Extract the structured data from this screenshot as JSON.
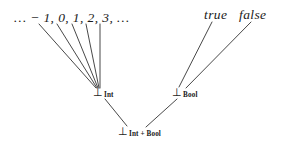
{
  "figure": {
    "type": "hasse-diagram",
    "background_color": "#ffffff",
    "line_color": "#333333",
    "text_color": "#1a1a1a",
    "width": 284,
    "height": 149
  },
  "labels": {
    "integers": "… − 1, 0, 1, 2, 3, …",
    "true": "true",
    "false": "false"
  },
  "nodes": [
    {
      "id": "bot-int",
      "tack": "⊥",
      "subscript": "Int",
      "x": 97,
      "y": 92
    },
    {
      "id": "bot-bool",
      "tack": "⊥",
      "subscript": "Bool",
      "x": 176,
      "y": 92
    },
    {
      "id": "bot-int-bool",
      "tack": "⊥",
      "subscript": "Int + Bool",
      "x": 122,
      "y": 131
    }
  ],
  "edges": [
    {
      "from": "int-elem-1",
      "x1": 39,
      "y1": 24,
      "x2": 96,
      "y2": 88
    },
    {
      "from": "int-elem-2",
      "x1": 57,
      "y1": 24,
      "x2": 97,
      "y2": 88
    },
    {
      "from": "int-elem-3",
      "x1": 72,
      "y1": 24,
      "x2": 98,
      "y2": 88
    },
    {
      "from": "int-elem-4",
      "x1": 86,
      "y1": 24,
      "x2": 99,
      "y2": 88
    },
    {
      "from": "int-elem-5",
      "x1": 100,
      "y1": 24,
      "x2": 100,
      "y2": 88
    },
    {
      "from": "true",
      "x1": 212,
      "y1": 22,
      "x2": 179,
      "y2": 87
    },
    {
      "from": "false",
      "x1": 251,
      "y1": 22,
      "x2": 186,
      "y2": 88
    },
    {
      "from": "bot-int",
      "x1": 105,
      "y1": 99,
      "x2": 127,
      "y2": 126
    },
    {
      "from": "bot-bool",
      "x1": 177,
      "y1": 99,
      "x2": 146,
      "y2": 127
    }
  ]
}
